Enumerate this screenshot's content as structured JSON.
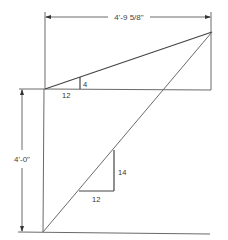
{
  "diagram": {
    "type": "roof-rafter-layout",
    "dimensions": {
      "horizontal": "4'-9 5/8\"",
      "vertical": "4'-0\""
    },
    "slope_triangles": [
      {
        "name": "upper",
        "run": "12",
        "rise": "4"
      },
      {
        "name": "lower",
        "run": "12",
        "rise": "14"
      }
    ],
    "colors": {
      "line": "#6a6a6a",
      "text": "#333333",
      "background": "#ffffff"
    }
  }
}
